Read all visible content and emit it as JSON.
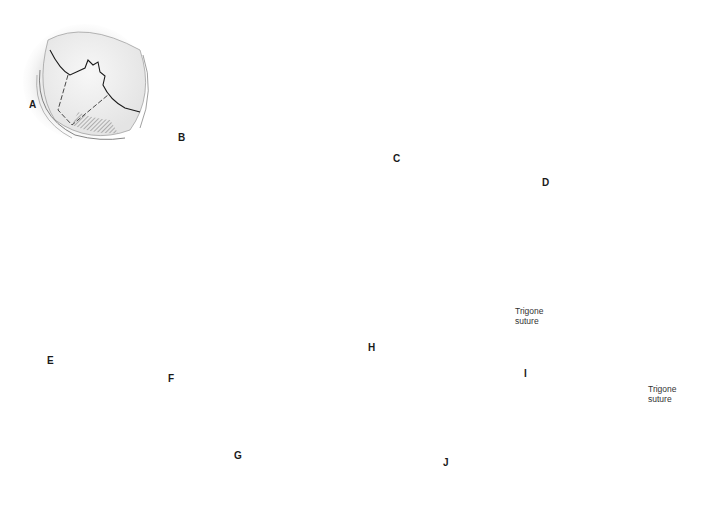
{
  "figure": {
    "panels": [
      {
        "id": "A",
        "label": "A"
      },
      {
        "id": "B",
        "label": "B"
      },
      {
        "id": "C",
        "label": "C"
      },
      {
        "id": "D",
        "label": "D"
      },
      {
        "id": "E",
        "label": "E"
      },
      {
        "id": "F",
        "label": "F"
      },
      {
        "id": "G",
        "label": "G"
      },
      {
        "id": "H",
        "label": "H"
      },
      {
        "id": "I",
        "label": "I"
      },
      {
        "id": "J",
        "label": "J"
      }
    ],
    "callouts": {
      "h_trigone_line1": "Trigone",
      "h_trigone_line2": "suture",
      "i_trigone_line1": "Trigone",
      "i_trigone_line2": "suture"
    },
    "colors": {
      "background": "#ffffff",
      "tissue_shadow": "#e6e6e6",
      "tissue_fill": "#f2f2f2",
      "line": "#1a1a1a",
      "instrument": "#9a9a9a",
      "instrument_dark": "#555555"
    }
  }
}
